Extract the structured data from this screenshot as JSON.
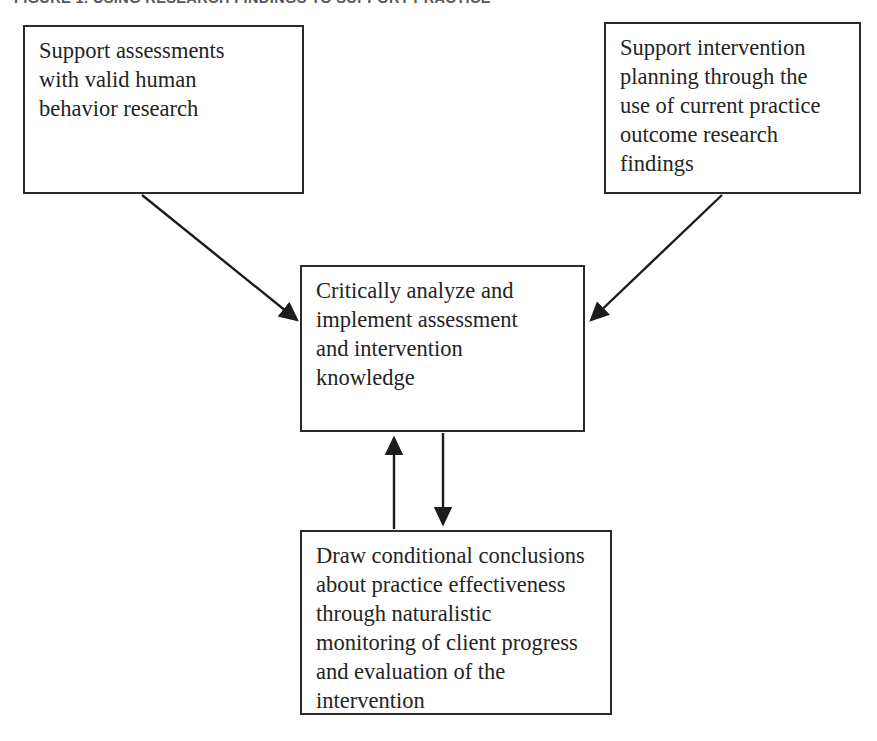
{
  "figure": {
    "caption": "Figure 1. Using Research Findings to Support Practice",
    "type": "flowchart",
    "orientation": "two-sources-converging-to-center-with-feedback-loop"
  },
  "nodes": [
    {
      "id": "support-assessments",
      "name": "box-assessment",
      "text": "Support assessments\nwith valid human\nbehavior research",
      "position": {
        "x": 23,
        "y": 25,
        "width": 281,
        "height": 169
      }
    },
    {
      "id": "support-intervention",
      "name": "box-intervention",
      "text": "Support intervention\nplanning through the\nuse of current practice\noutcome research\nfindings",
      "position": {
        "x": 604,
        "y": 22,
        "width": 257,
        "height": 172
      }
    },
    {
      "id": "critically-analyze",
      "name": "box-analyze",
      "text": "Critically analyze and\nimplement assessment\nand intervention\nknowledge",
      "position": {
        "x": 300,
        "y": 265,
        "width": 285,
        "height": 167
      }
    },
    {
      "id": "draw-conclusions",
      "name": "box-conclusions",
      "text": "Draw conditional conclusions\nabout practice effectiveness\nthrough naturalistic\nmonitoring of client progress\nand evaluation of the\nintervention",
      "position": {
        "x": 300,
        "y": 530,
        "width": 312,
        "height": 185
      }
    }
  ],
  "connectors": [
    {
      "id": "assessment-to-analyze",
      "name": "arrow-assessment-to-analyze",
      "from": "support-assessments",
      "to": "critically-analyze",
      "style": "diagonal-down-right",
      "arrowhead": "end"
    },
    {
      "id": "intervention-to-analyze",
      "name": "arrow-intervention-to-analyze",
      "from": "support-intervention",
      "to": "critically-analyze",
      "style": "diagonal-down-left",
      "arrowhead": "end"
    },
    {
      "id": "conclusions-to-analyze",
      "name": "arrow-conclusions-to-analyze",
      "from": "draw-conclusions",
      "to": "critically-analyze",
      "style": "vertical-up",
      "arrowhead": "end"
    },
    {
      "id": "analyze-to-conclusions",
      "name": "arrow-analyze-to-conclusions",
      "from": "critically-analyze",
      "to": "draw-conclusions",
      "style": "vertical-down",
      "arrowhead": "end"
    }
  ],
  "colors": {
    "page_background": "#ffffff",
    "box_border": "#2a2a2a",
    "text": "#242424",
    "caption": "#55555c",
    "connector": "#1c1c1c"
  }
}
